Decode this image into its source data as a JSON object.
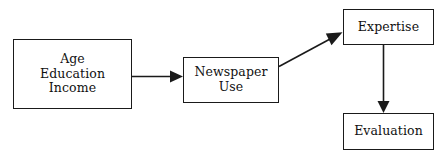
{
  "diagram": {
    "type": "flow-diagram",
    "background_color": "#ffffff",
    "line_color": "#1a1a1a",
    "text_color": "#111111",
    "nodes": [
      {
        "id": "predictors",
        "label": "Age\nEducation\nIncome",
        "lines": [
          "Age",
          "Education",
          "Income"
        ]
      },
      {
        "id": "newspaper_use",
        "label": "Newspaper\nUse",
        "lines": [
          "Newspaper",
          "Use"
        ]
      },
      {
        "id": "expertise",
        "label": "Expertise",
        "lines": [
          "Expertise"
        ]
      },
      {
        "id": "evaluation",
        "label": "Evaluation",
        "lines": [
          "Evaluation"
        ]
      }
    ],
    "edges": [
      {
        "id": "predictors-to-newspaper",
        "from": "predictors",
        "to": "newspaper_use",
        "direction": "horizontal-right"
      },
      {
        "id": "newspaper-to-expertise",
        "from": "newspaper_use",
        "to": "expertise",
        "direction": "diagonal-up-right"
      },
      {
        "id": "expertise-to-evaluation",
        "from": "expertise",
        "to": "evaluation",
        "direction": "vertical-down"
      }
    ]
  }
}
